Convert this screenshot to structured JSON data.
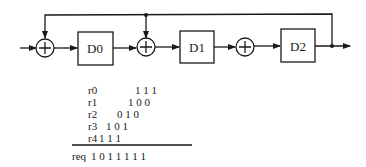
{
  "diagram": {
    "registers": [
      {
        "label": "D0"
      },
      {
        "label": "D1"
      },
      {
        "label": "D2"
      }
    ],
    "adders": [
      "adder-1",
      "adder-2",
      "adder-3"
    ],
    "colors": {
      "stroke": "#1a1a1a",
      "background": "#ffffff"
    }
  },
  "table": {
    "rows": [
      {
        "name": "r0",
        "bits": "1 1 1"
      },
      {
        "name": "r1",
        "bits": "1 0 0"
      },
      {
        "name": "r2",
        "bits": "0 1 0"
      },
      {
        "name": "r3",
        "bits": "1 0 1"
      },
      {
        "name": "r4",
        "bits": "1 1 1"
      }
    ],
    "result": {
      "name": "req",
      "bits": "1 0 1 1 1 1 1"
    }
  }
}
